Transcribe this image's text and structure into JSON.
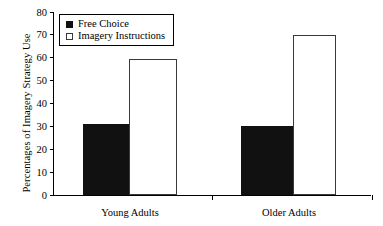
{
  "chart_data": {
    "type": "bar",
    "title": "",
    "xlabel": "",
    "ylabel": "Percentages of Imagery Strategy Use",
    "categories": [
      "Young Adults",
      "Older Adults"
    ],
    "series": [
      {
        "name": "Free Choice",
        "values": [
          31,
          30
        ],
        "color": "#111111",
        "style": "filled"
      },
      {
        "name": "Imagery Instructions",
        "values": [
          59.5,
          70
        ],
        "color": "#ffffff",
        "style": "open"
      }
    ],
    "ylim": [
      0,
      80
    ],
    "ytick_values": [
      0,
      10,
      20,
      30,
      40,
      50,
      60,
      70,
      80
    ],
    "ytick_labels": [
      "0",
      "10",
      "20",
      "30",
      "40",
      "50",
      "60",
      "70",
      "80"
    ],
    "grid": false,
    "legend_position": "upper left inside"
  }
}
